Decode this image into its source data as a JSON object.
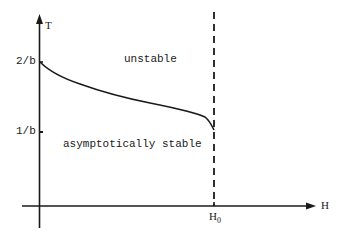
{
  "diagram": {
    "axes": {
      "y_label": "T",
      "x_label": "H",
      "y_ticks": [
        {
          "label": "2/b",
          "y": 62
        },
        {
          "label": "1/b",
          "y": 132
        }
      ],
      "x_marker": {
        "label": "H",
        "subscript": "0"
      }
    },
    "regions": {
      "upper": "unstable",
      "lower": "asymptotically stable"
    },
    "curve": {
      "description": "decreasing stability boundary from T=2/b at H=0 to T=1/b at H=H0",
      "start": "2/b",
      "end": "1/b"
    },
    "boundary_line": {
      "style": "dashed",
      "at": "H0"
    },
    "colors": {
      "ink": "#1a1a1a",
      "background": "#ffffff"
    }
  }
}
